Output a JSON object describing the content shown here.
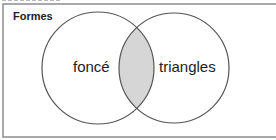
{
  "diagram": {
    "type": "venn",
    "universe": {
      "label": "Formes"
    },
    "sets": [
      {
        "label": "foncé"
      },
      {
        "label": "triangles"
      }
    ],
    "shaded_region": "intersection",
    "colors": {
      "border": "#8c8c8c",
      "circle_stroke": "#555555",
      "intersection_fill": "#d6d6d6",
      "text": "#222222"
    }
  }
}
